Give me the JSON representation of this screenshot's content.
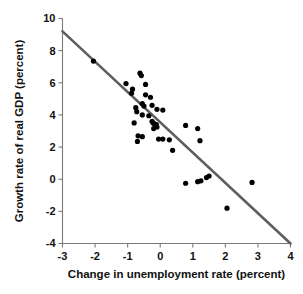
{
  "chart_data": {
    "type": "scatter",
    "title": "",
    "xlabel": "Change in unemployment rate (percent)",
    "ylabel": "Growth rate of real GDP (percent)",
    "xlim": [
      -3,
      4
    ],
    "ylim": [
      -4,
      10
    ],
    "xticks": [
      "-3",
      "-2",
      "-1",
      "0",
      "1",
      "2",
      "3",
      "4"
    ],
    "xtick_values": [
      -3,
      -2,
      -1,
      0,
      1,
      2,
      3,
      4
    ],
    "yticks": [
      "10",
      "8",
      "6",
      "4",
      "2",
      "0",
      "-2",
      "-4"
    ],
    "ytick_values": [
      10,
      8,
      6,
      4,
      2,
      0,
      -2,
      -4
    ],
    "grid": false,
    "legend": null,
    "point_color": "#000000",
    "line_color": "#5e5e5e",
    "axis_color": "#7a7a7a",
    "series": [
      {
        "name": "Okun's law observations",
        "marker": "circle",
        "points": [
          [
            -2.05,
            7.35
          ],
          [
            -0.62,
            6.6
          ],
          [
            -0.58,
            6.45
          ],
          [
            -1.05,
            5.95
          ],
          [
            -0.45,
            5.9
          ],
          [
            -0.85,
            5.6
          ],
          [
            -0.88,
            5.35
          ],
          [
            -0.45,
            5.25
          ],
          [
            -0.3,
            5.1
          ],
          [
            -0.55,
            4.7
          ],
          [
            -0.5,
            4.55
          ],
          [
            -0.25,
            4.6
          ],
          [
            -0.75,
            4.45
          ],
          [
            -0.72,
            4.2
          ],
          [
            -0.55,
            4.0
          ],
          [
            -0.35,
            3.95
          ],
          [
            -0.1,
            4.35
          ],
          [
            0.08,
            4.3
          ],
          [
            -0.8,
            3.5
          ],
          [
            -0.25,
            3.6
          ],
          [
            -0.22,
            3.5
          ],
          [
            -0.18,
            3.45
          ],
          [
            -0.12,
            3.4
          ],
          [
            0.78,
            3.35
          ],
          [
            1.15,
            3.15
          ],
          [
            -0.1,
            3.25
          ],
          [
            -0.2,
            3.15
          ],
          [
            -0.68,
            2.7
          ],
          [
            -0.55,
            2.65
          ],
          [
            -0.05,
            2.5
          ],
          [
            0.08,
            2.5
          ],
          [
            0.28,
            2.45
          ],
          [
            1.22,
            2.4
          ],
          [
            -0.7,
            2.35
          ],
          [
            0.38,
            1.8
          ],
          [
            0.78,
            -0.25
          ],
          [
            1.15,
            -0.15
          ],
          [
            1.25,
            -0.1
          ],
          [
            1.42,
            0.1
          ],
          [
            1.5,
            0.2
          ],
          [
            2.82,
            -0.2
          ],
          [
            2.05,
            -1.8
          ]
        ]
      }
    ],
    "trendline": {
      "name": "fitted regression line",
      "start": [
        -3,
        9.2
      ],
      "end": [
        4,
        -4
      ]
    }
  }
}
